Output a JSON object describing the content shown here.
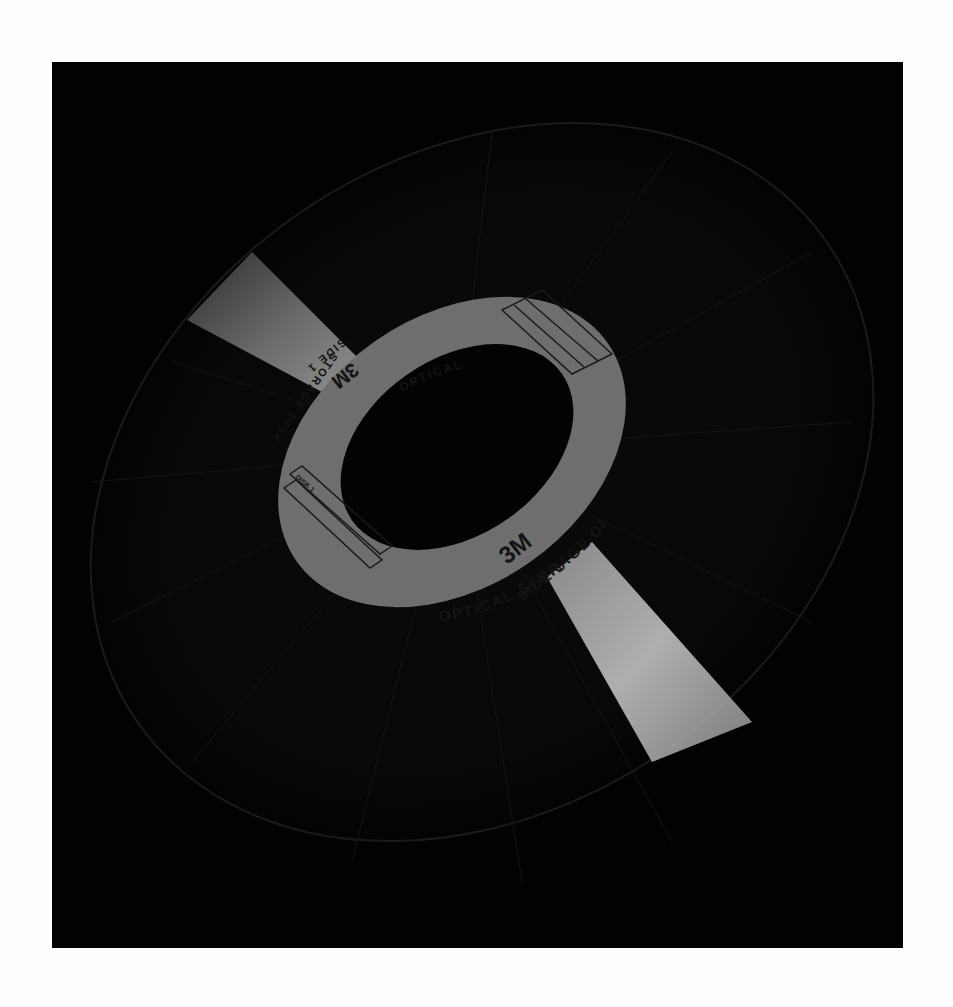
{
  "image": {
    "subject": "3M optical storage disk photographed at an angle on black background",
    "background_color": "#fdfdfd",
    "frame_color": "#020202",
    "label_color": "#6e6e6e",
    "label_text_color": "#141414"
  },
  "label": {
    "brand": "3M",
    "text_bottom_line1": "OPTICAL STORAGE DISK",
    "text_bottom_line2": "SIDE 1",
    "text_top_line1": "OPTICAL",
    "text_top_line2": "STORAGE DISK",
    "text_top_line3": "SIDE 1",
    "write_box_tag": "DISK 1"
  }
}
